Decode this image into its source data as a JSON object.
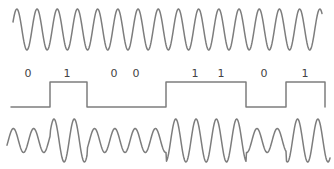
{
  "diagram": {
    "stroke_color": "#7d7d7d",
    "label_color": "#444444",
    "carrier": {
      "name": "carrier-wave",
      "x_start": 13,
      "x_end": 322,
      "center_y": 29.5,
      "amplitude": 20.5,
      "period": 20.2,
      "start_phase_y": 22
    },
    "digital_signal": {
      "name": "binary-data-signal",
      "bits": [
        "0",
        "1",
        "0",
        "0",
        "1",
        "1",
        "0",
        "1"
      ],
      "label_positions_x": [
        28,
        67,
        114,
        136,
        195,
        221,
        264,
        305
      ],
      "label_y": 77,
      "high_y": 82,
      "low_y": 107,
      "transitions_x": [
        11,
        50,
        87,
        166,
        246,
        286,
        325
      ],
      "levels": [
        "low",
        "high",
        "low",
        "high",
        "low",
        "high"
      ]
    },
    "modulated": {
      "name": "modulated-wave",
      "x_start": 7,
      "x_end": 330,
      "center_y": 140.5,
      "period": 20.3,
      "low_amplitude": 12,
      "high_amplitude": 21.5,
      "segments": [
        {
          "from": 7,
          "to": 50,
          "level": "low"
        },
        {
          "from": 50,
          "to": 87,
          "level": "high"
        },
        {
          "from": 87,
          "to": 166,
          "level": "low"
        },
        {
          "from": 166,
          "to": 246,
          "level": "high"
        },
        {
          "from": 246,
          "to": 286,
          "level": "low"
        },
        {
          "from": 286,
          "to": 330,
          "level": "high"
        }
      ]
    }
  }
}
